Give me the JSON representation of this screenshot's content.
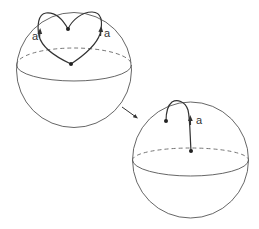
{
  "diagram": {
    "sphere_1": {
      "label_left": "a",
      "label_right": "a",
      "points": 2
    },
    "transition_arrow": "arrow-right-down",
    "sphere_2": {
      "label": "a",
      "points": 2
    }
  },
  "colors": {
    "stroke": "#444444",
    "background": "#ffffff"
  }
}
